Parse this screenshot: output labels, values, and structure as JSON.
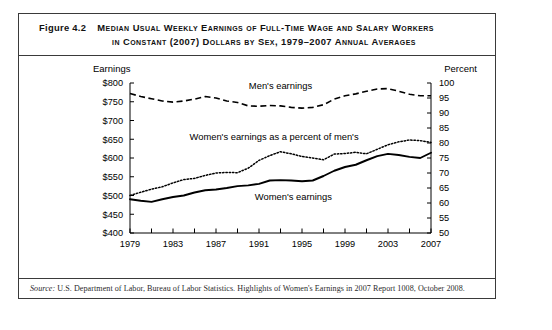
{
  "figure": {
    "number": "Figure 4.2",
    "title_line_1": "Median Usual Weekly Earnings of Full-Time Wage and Salary Workers",
    "title_line_2": "in Constant (2007) Dollars by Sex, 1979–2007 Annual Averages",
    "source_prefix": "Source:",
    "source_body": "U.S. Department of Labor, Bureau of Labor Statistics. Highlights of Women's Earnings in 2007 Report 1008, October 2008."
  },
  "axes": {
    "left_title": "Earnings",
    "right_title": "Percent",
    "left_ticks": [
      "$800",
      "$750",
      "$700",
      "$650",
      "$600",
      "$550",
      "$500",
      "$450",
      "$400"
    ],
    "right_ticks": [
      "100",
      "95",
      "90",
      "85",
      "80",
      "75",
      "70",
      "65",
      "60",
      "55",
      "50"
    ],
    "x_ticks": [
      "1979",
      "1983",
      "1987",
      "1991",
      "1995",
      "1999",
      "2003",
      "2007"
    ]
  },
  "labels": {
    "mens_earnings": "Men's earnings",
    "ratio": "Women's earnings as a percent of men's",
    "womens_earnings": "Women's earnings"
  },
  "chart_data": {
    "type": "line",
    "xlabel": "",
    "ylabel": "Earnings",
    "ylabel_right": "Percent",
    "ylim": [
      400,
      800
    ],
    "ylim_right": [
      50,
      100
    ],
    "xlim": [
      1979,
      2007
    ],
    "grid": false,
    "legend": "inline-annotations",
    "x": [
      1979,
      1980,
      1981,
      1982,
      1983,
      1984,
      1985,
      1986,
      1987,
      1988,
      1989,
      1990,
      1991,
      1992,
      1993,
      1994,
      1995,
      1996,
      1997,
      1998,
      1999,
      2000,
      2001,
      2002,
      2003,
      2004,
      2005,
      2006,
      2007
    ],
    "series": [
      {
        "name": "Men's earnings",
        "style": "dashed",
        "axis": "left",
        "units": "2007 dollars",
        "values": [
          772,
          764,
          758,
          752,
          749,
          752,
          757,
          764,
          760,
          752,
          748,
          739,
          738,
          740,
          739,
          735,
          733,
          735,
          742,
          757,
          766,
          771,
          778,
          784,
          785,
          778,
          770,
          766,
          766
        ]
      },
      {
        "name": "Women's earnings",
        "style": "solid",
        "axis": "left",
        "units": "2007 dollars",
        "values": [
          490,
          486,
          483,
          490,
          496,
          500,
          508,
          514,
          516,
          520,
          525,
          527,
          531,
          540,
          541,
          540,
          538,
          540,
          552,
          566,
          576,
          582,
          594,
          605,
          611,
          608,
          603,
          600,
          614
        ]
      },
      {
        "name": "Women's earnings as a percent of men's",
        "style": "dotted",
        "axis": "right",
        "units": "percent",
        "values": [
          62.5,
          63.6,
          64.6,
          65.4,
          66.7,
          67.8,
          68.2,
          69.2,
          70.0,
          70.2,
          70.1,
          71.6,
          74.2,
          75.8,
          77.1,
          76.4,
          75.5,
          75.0,
          74.4,
          76.3,
          76.5,
          76.9,
          76.4,
          77.9,
          79.4,
          80.4,
          81.0,
          80.8,
          80.2
        ]
      }
    ]
  }
}
